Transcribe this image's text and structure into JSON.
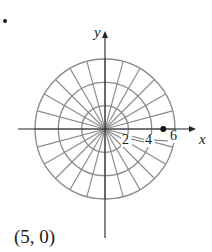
{
  "figure": {
    "type": "polar-grid",
    "axis_labels": {
      "x": "x",
      "y": "y"
    },
    "radial_tick_labels": [
      "2",
      "4",
      "6"
    ],
    "circle_radii": [
      2,
      4,
      6
    ],
    "angle_step_degrees": 15,
    "plotted_point": {
      "r": 5,
      "theta": 0
    },
    "colors": {
      "grid": "#8a8a8a",
      "axis": "#222222",
      "point": "#111111"
    }
  },
  "caption": "(5, 0)"
}
